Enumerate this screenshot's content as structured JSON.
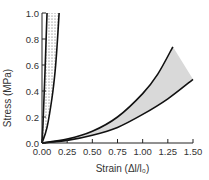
{
  "chart_data": {
    "type": "line",
    "title": "",
    "xlabel": "Strain (Δl/l₀)",
    "ylabel": "Stress (MPa)",
    "xlim": [
      0,
      1.5
    ],
    "ylim": [
      0,
      1.0
    ],
    "x_ticks": [
      "0.00",
      "0.25",
      "0.50",
      "0.75",
      "1.00",
      "1.25",
      "1.50"
    ],
    "y_ticks": [
      "0.0",
      "0.2",
      "0.4",
      "0.6",
      "0.8",
      "1.0"
    ],
    "grid": false,
    "legend": null,
    "bands": [
      {
        "name": "steep-band",
        "fill": "dotted",
        "upper": {
          "x": [
            0,
            0.01,
            0.02,
            0.03,
            0.04,
            0.05
          ],
          "y": [
            0,
            0.15,
            0.35,
            0.55,
            0.78,
            1.0
          ]
        },
        "lower": {
          "x": [
            0,
            0.05,
            0.1,
            0.13,
            0.15,
            0.17
          ],
          "y": [
            0,
            0.12,
            0.35,
            0.55,
            0.75,
            1.0
          ]
        }
      },
      {
        "name": "shallow-band",
        "fill": "#d9d9d9",
        "upper": {
          "x": [
            0,
            0.25,
            0.5,
            0.75,
            1.0,
            1.15,
            1.3
          ],
          "y": [
            0,
            0.03,
            0.09,
            0.2,
            0.38,
            0.53,
            0.74
          ]
        },
        "lower": {
          "x": [
            0,
            0.25,
            0.5,
            0.75,
            1.0,
            1.25,
            1.5
          ],
          "y": [
            0,
            0.02,
            0.06,
            0.12,
            0.22,
            0.34,
            0.49
          ]
        }
      }
    ]
  }
}
